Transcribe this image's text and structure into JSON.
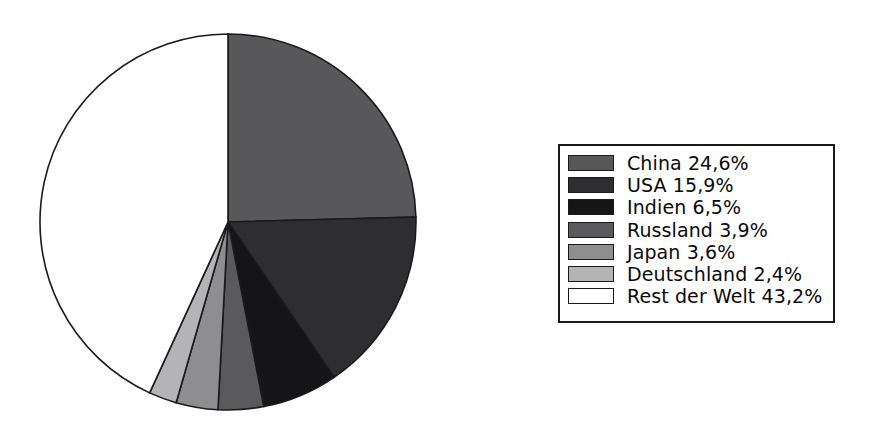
{
  "chart_data": {
    "type": "pie",
    "title": "",
    "labels": [
      "China",
      "USA",
      "Indien",
      "Russland",
      "Japan",
      "Deutschland",
      "Rest der Welt"
    ],
    "values": [
      24.6,
      15.9,
      6.5,
      3.9,
      3.6,
      2.4,
      43.2
    ],
    "value_strings": [
      "24,6%",
      "15,9%",
      "6,5%",
      "3,9%",
      "3,6%",
      "2,4%",
      "43,2%"
    ],
    "unit": "%",
    "decimal_separator": ",",
    "start_angle_deg": 0,
    "direction": "clockwise",
    "legend_position": "right",
    "grid": false,
    "colors": [
      "#58585a",
      "#2e2e30",
      "#151517",
      "#5a5a5c",
      "#8e8e90",
      "#b4b4b6",
      "#ffffff"
    ],
    "outline_color": "#1a1a1a",
    "slices": [
      {
        "label": "China",
        "value": 24.6,
        "value_text": "24,6%",
        "color": "#58585a"
      },
      {
        "label": "USA",
        "value": 15.9,
        "value_text": "15,9%",
        "color": "#2e2e30"
      },
      {
        "label": "Indien",
        "value": 6.5,
        "value_text": "6,5%",
        "color": "#151517"
      },
      {
        "label": "Russland",
        "value": 3.9,
        "value_text": "3,9%",
        "color": "#5a5a5c"
      },
      {
        "label": "Japan",
        "value": 3.6,
        "value_text": "3,6%",
        "color": "#8e8e90"
      },
      {
        "label": "Deutschland",
        "value": 2.4,
        "value_text": "2,4%",
        "color": "#b4b4b6"
      },
      {
        "label": "Rest der Welt",
        "value": 43.2,
        "value_text": "43,2%",
        "color": "#ffffff"
      }
    ]
  },
  "legend": {
    "entries": [
      {
        "text": "China 24,6%",
        "color": "#58585a"
      },
      {
        "text": "USA 15,9%",
        "color": "#2e2e30"
      },
      {
        "text": "Indien 6,5%",
        "color": "#151517"
      },
      {
        "text": "Russland 3,9%",
        "color": "#5a5a5c"
      },
      {
        "text": "Japan 3,6%",
        "color": "#8e8e90"
      },
      {
        "text": "Deutschland 2,4%",
        "color": "#b4b4b6"
      },
      {
        "text": "Rest der Welt 43,2%",
        "color": "#ffffff"
      }
    ]
  },
  "geometry": {
    "center_x": 228,
    "center_y": 222,
    "radius": 188
  }
}
